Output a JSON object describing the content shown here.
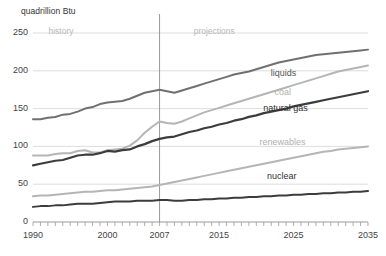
{
  "chart_data": {
    "type": "line",
    "title": "",
    "subtitle": "",
    "xlabel": "",
    "ylabel": "quadrillion Btu",
    "unit_label": "quadrillion Btu",
    "xlim": [
      1990,
      2035
    ],
    "ylim": [
      0,
      250
    ],
    "yticks": [
      0,
      50,
      100,
      150,
      200,
      250
    ],
    "ytick_labels": [
      "0",
      "50",
      "100",
      "150",
      "200",
      "250"
    ],
    "xticks": [
      1990,
      2000,
      2007,
      2015,
      2025,
      2035
    ],
    "xtick_labels": [
      "1990",
      "2000",
      "2007",
      "2015",
      "2025",
      "2035"
    ],
    "minor_xtick_interval": 1,
    "grid": "horizontal",
    "legend": "inline-labels",
    "annotations": [
      {
        "text": "history",
        "x": 1994.5,
        "y": 252,
        "color": "#b8b8b8"
      },
      {
        "text": "projections",
        "x": 2014,
        "y": 252,
        "color": "#b8b8b8"
      }
    ],
    "divider_year": 2007,
    "x": [
      1990,
      1991,
      1992,
      1993,
      1994,
      1995,
      1996,
      1997,
      1998,
      1999,
      2000,
      2001,
      2002,
      2003,
      2004,
      2005,
      2006,
      2007,
      2008,
      2009,
      2010,
      2011,
      2012,
      2013,
      2014,
      2015,
      2016,
      2017,
      2018,
      2019,
      2020,
      2021,
      2022,
      2023,
      2024,
      2025,
      2026,
      2027,
      2028,
      2029,
      2030,
      2031,
      2032,
      2033,
      2034,
      2035
    ],
    "series": [
      {
        "name": "liquids",
        "label": "liquids",
        "color": "#707070",
        "width": 2.0,
        "label_pos": {
          "x": 2026.5,
          "y": 196
        },
        "values": [
          136,
          136,
          138,
          139,
          142,
          143,
          146,
          150,
          152,
          156,
          158,
          159,
          160,
          163,
          167,
          171,
          173,
          175,
          173,
          171,
          174,
          177,
          180,
          183,
          186,
          189,
          192,
          195,
          197,
          199,
          202,
          205,
          208,
          211,
          213,
          215,
          217,
          219,
          221,
          222,
          223,
          224,
          225,
          226,
          227,
          228
        ]
      },
      {
        "name": "coal",
        "label": "coal",
        "color": "#b5b5b5",
        "width": 2.0,
        "label_pos": {
          "x": 2027,
          "y": 170
        },
        "values": [
          88,
          88,
          88,
          90,
          91,
          91,
          94,
          95,
          92,
          92,
          95,
          96,
          97,
          101,
          108,
          118,
          126,
          133,
          131,
          130,
          133,
          137,
          141,
          145,
          148,
          151,
          154,
          157,
          160,
          163,
          166,
          169,
          172,
          175,
          178,
          181,
          184,
          187,
          190,
          193,
          196,
          199,
          201,
          203,
          205,
          207
        ]
      },
      {
        "name": "natural gas",
        "label": "natural gas",
        "color": "#3c3c3c",
        "width": 2.2,
        "label_pos": {
          "x": 2025.5,
          "y": 150
        },
        "values": [
          75,
          77,
          79,
          81,
          82,
          85,
          88,
          89,
          89,
          91,
          94,
          93,
          95,
          96,
          100,
          103,
          107,
          110,
          112,
          113,
          116,
          119,
          121,
          124,
          126,
          129,
          131,
          134,
          136,
          139,
          141,
          144,
          146,
          148,
          150,
          153,
          155,
          157,
          159,
          161,
          163,
          165,
          167,
          169,
          171,
          173
        ]
      },
      {
        "name": "renewables",
        "label": "renewables",
        "color": "#b5b5b5",
        "width": 2.0,
        "label_pos": {
          "x": 2025,
          "y": 105
        },
        "values": [
          34,
          35,
          35,
          36,
          37,
          38,
          39,
          40,
          40,
          41,
          42,
          42,
          43,
          44,
          45,
          46,
          47,
          49,
          51,
          53,
          55,
          57,
          59,
          61,
          63,
          65,
          67,
          69,
          71,
          73,
          75,
          77,
          79,
          81,
          83,
          85,
          87,
          89,
          91,
          93,
          94,
          96,
          97,
          98,
          99,
          100
        ]
      },
      {
        "name": "nuclear",
        "label": "nuclear",
        "color": "#3c3c3c",
        "width": 2.0,
        "label_pos": {
          "x": 2026,
          "y": 59
        },
        "values": [
          20,
          21,
          21,
          22,
          22,
          23,
          24,
          24,
          24,
          25,
          26,
          27,
          27,
          27,
          28,
          28,
          28,
          29,
          29,
          28,
          28,
          29,
          29,
          30,
          30,
          31,
          31,
          32,
          32,
          33,
          33,
          34,
          34,
          35,
          35,
          36,
          36,
          37,
          37,
          38,
          38,
          39,
          39,
          40,
          40,
          41
        ]
      }
    ],
    "plot_geometry": {
      "left_px": 33,
      "right_px": 368,
      "top_px": 33,
      "bottom_px": 222
    }
  }
}
